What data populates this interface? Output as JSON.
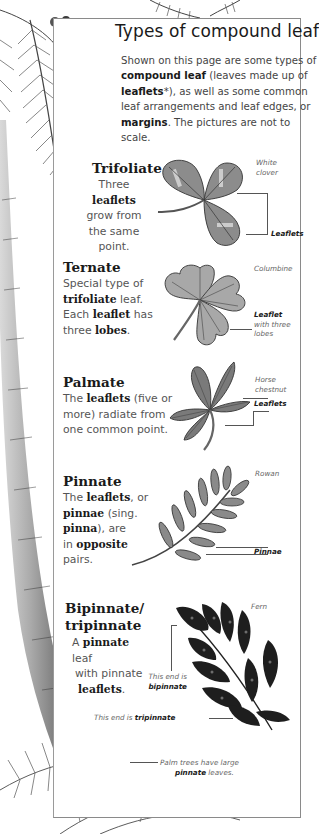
{
  "page": {
    "title": "Types of compound leaf",
    "intro": [
      {
        "t": "Shown on this page are some types of ",
        "b": false
      },
      {
        "t": "compound leaf",
        "b": true
      },
      {
        "t": " (leaves made up of ",
        "b": false
      },
      {
        "t": "leaflets",
        "b": true
      },
      {
        "t": "*), as well as some common leaf arrangements and leaf edges, or ",
        "b": false
      },
      {
        "t": "margins",
        "b": true
      },
      {
        "t": ". The pictures are not to scale.",
        "b": false
      }
    ]
  },
  "sections": [
    {
      "id": "trifoliate",
      "title": "Trifoliate",
      "lines": [
        "Three",
        "leaflets",
        "grow from",
        "the same point."
      ],
      "bold_lines": [
        1
      ],
      "plant_caption": [
        "White",
        "clover"
      ],
      "label": "Leaflets"
    },
    {
      "id": "ternate",
      "title": "Ternate",
      "body": [
        [
          {
            "t": "Special type of",
            "b": false
          }
        ],
        [
          {
            "t": "trifoliate",
            "b": true
          },
          {
            "t": " leaf.",
            "b": false
          }
        ],
        [
          {
            "t": "Each ",
            "b": false
          },
          {
            "t": "leaflet",
            "b": true
          },
          {
            "t": " has",
            "b": false
          }
        ],
        [
          {
            "t": "three ",
            "b": false
          },
          {
            "t": "lobes",
            "b": true
          },
          {
            "t": ".",
            "b": false
          }
        ]
      ],
      "plant_caption": [
        "Columbine"
      ],
      "label_bold": "Leaflet",
      "label_rest": [
        "with three",
        "lobes"
      ]
    },
    {
      "id": "palmate",
      "title": "Palmate",
      "body": [
        [
          {
            "t": "The ",
            "b": false
          },
          {
            "t": "leaflets",
            "b": true
          },
          {
            "t": " (five or",
            "b": false
          }
        ],
        [
          {
            "t": "more) radiate from",
            "b": false
          }
        ],
        [
          {
            "t": "one common point.",
            "b": false
          }
        ]
      ],
      "plant_caption": [
        "Horse",
        "chestnut"
      ],
      "label": "Leaflets"
    },
    {
      "id": "pinnate",
      "title": "Pinnate",
      "body": [
        [
          {
            "t": "The ",
            "b": false
          },
          {
            "t": "leaflets",
            "b": true
          },
          {
            "t": ", or",
            "b": false
          }
        ],
        [
          {
            "t": "pinnae",
            "b": true
          },
          {
            "t": " (sing.",
            "b": false
          }
        ],
        [
          {
            "t": "pinna",
            "b": true
          },
          {
            "t": "), are",
            "b": false
          }
        ],
        [
          {
            "t": "in ",
            "b": false
          },
          {
            "t": "opposite",
            "b": true
          }
        ],
        [
          {
            "t": "pairs.",
            "b": false
          }
        ]
      ],
      "plant_caption": [
        "Rowan"
      ],
      "label": "Pinnae"
    },
    {
      "id": "bipinnate",
      "title_lines": [
        "Bipinnate/",
        "tripinnate"
      ],
      "body": [
        [
          {
            "t": "A ",
            "b": false
          },
          {
            "t": "pinnate",
            "b": true
          },
          {
            "t": " leaf",
            "b": false
          }
        ],
        [
          {
            "t": "with pinnate",
            "b": false
          }
        ],
        [
          {
            "t": "leaflets",
            "b": true
          },
          {
            "t": ".",
            "b": false
          }
        ]
      ],
      "plant_caption": [
        "Fern"
      ],
      "bipinnate_label": {
        "pre": "This end is",
        "bold": "bipinnate"
      },
      "tripinnate_label": {
        "pre": "This end is ",
        "bold": "tripinnate"
      }
    }
  ],
  "palm_note": {
    "line1": "Palm trees have large",
    "bold": "pinnate",
    "rest": " leaves."
  },
  "colors": {
    "panel_border": "#8a8a8a",
    "leaf_fill": "#8c8c8c",
    "leaf_dark": "#6e6e6e",
    "text_dark": "#1a1a1a",
    "text_body": "#555555"
  }
}
